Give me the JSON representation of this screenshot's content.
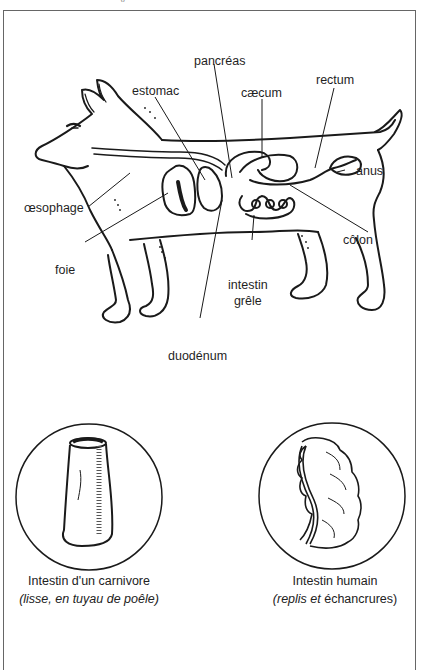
{
  "header": {
    "cut_off_title": "…y … … … … …"
  },
  "dog_diagram": {
    "labels": {
      "pancreas": "pancréas",
      "estomac": "estomac",
      "rectum": "rectum",
      "caecum": "cæcum",
      "anus": "anus",
      "oesophage": "œsophage",
      "colon": "côlon",
      "foie": "foie",
      "intestin_grele_1": "intestin",
      "intestin_grele_2": "grêle",
      "duodenum": "duodénum"
    }
  },
  "comparison": {
    "carnivore": {
      "title": "Intestin d'un carnivore",
      "subtitle": "(lisse, en tuyau de poêle)"
    },
    "human": {
      "title": "Intestin humain",
      "subtitle_open": "(",
      "subtitle_italic_1": "replis",
      "subtitle_mid": " et ",
      "subtitle_plain": "échancrures",
      "subtitle_close": ")"
    }
  },
  "colors": {
    "ink": "#1a1a1a",
    "frame": "#666666",
    "background": "#ffffff"
  }
}
